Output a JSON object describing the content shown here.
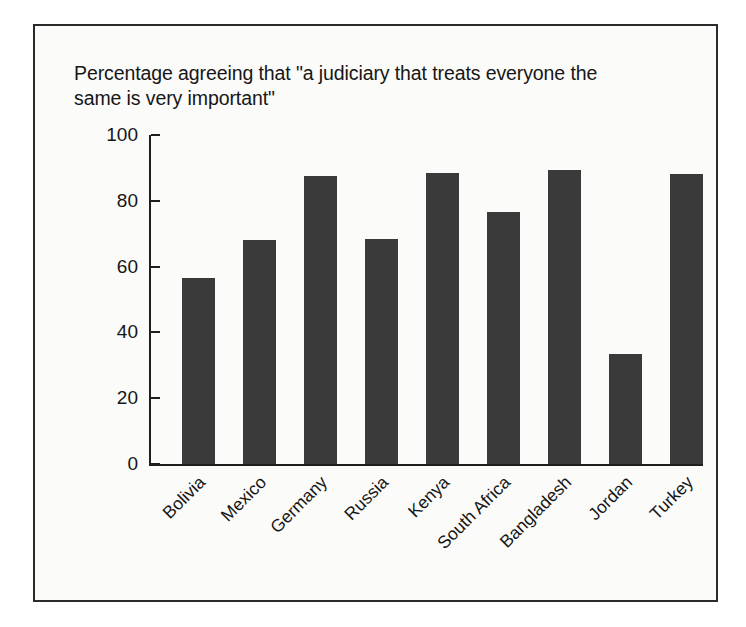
{
  "figure": {
    "title": "Percentage agreeing that \"a judiciary that treats everyone the\nsame is very important\"",
    "frame_color": "#2b2b2b",
    "background": "#fbfbfa",
    "bar_color": "#3a3a3a",
    "axis_color": "#1f1f1f"
  },
  "chart_data": {
    "type": "bar",
    "title": "Percentage agreeing that \"a judiciary that treats everyone the same is very important\"",
    "xlabel": "",
    "ylabel": "",
    "ylim": [
      0,
      100
    ],
    "yticks": [
      0,
      20,
      40,
      60,
      80,
      100
    ],
    "ytick_labels": [
      "0",
      "20",
      "40",
      "60",
      "80",
      "100"
    ],
    "grid": false,
    "legend": false,
    "x_tick_rotation": -45,
    "categories": [
      "Bolivia",
      "Mexico",
      "Germany",
      "Russia",
      "Kenya",
      "South Africa",
      "Bangladesh",
      "Jordan",
      "Turkey"
    ],
    "values": [
      56.5,
      68,
      87.5,
      68.5,
      88.5,
      76.5,
      89.5,
      33.5,
      88
    ]
  }
}
